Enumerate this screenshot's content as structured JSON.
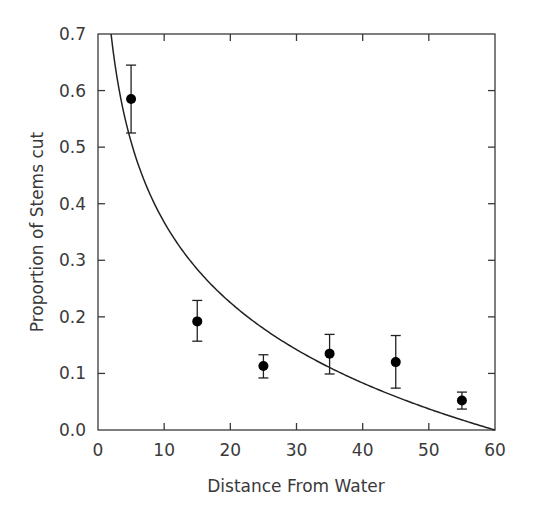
{
  "chart_data": {
    "type": "scatter",
    "title": "",
    "xlabel": "Distance From Water",
    "ylabel": "Proportion of Stems cut",
    "xlim": [
      0,
      60
    ],
    "ylim": [
      0.0,
      0.7
    ],
    "xticks": [
      0,
      10,
      20,
      30,
      40,
      50,
      60
    ],
    "xtick_labels": [
      "0",
      "10",
      "20",
      "30",
      "40",
      "50",
      "60"
    ],
    "yticks": [
      0.0,
      0.1,
      0.2,
      0.3,
      0.4,
      0.5,
      0.6,
      0.7
    ],
    "ytick_labels": [
      "0.0",
      "0.1",
      "0.2",
      "0.3",
      "0.4",
      "0.5",
      "0.6",
      "0.7"
    ],
    "grid": false,
    "legend": null,
    "series": [
      {
        "name": "observed",
        "kind": "points_with_error_bars",
        "x": [
          5,
          15,
          25,
          35,
          45,
          55
        ],
        "y": [
          0.585,
          0.192,
          0.113,
          0.135,
          0.12,
          0.052
        ],
        "err_low": [
          0.525,
          0.157,
          0.092,
          0.099,
          0.074,
          0.037
        ],
        "err_high": [
          0.645,
          0.229,
          0.133,
          0.169,
          0.167,
          0.067
        ]
      },
      {
        "name": "fitted curve",
        "kind": "line",
        "formula": "y = 0.205 * ln(60 / x)",
        "x": [
          3.5,
          5,
          7.5,
          10,
          15,
          20,
          25,
          30,
          35,
          40,
          45,
          50,
          55,
          60
        ],
        "y": [
          0.583,
          0.509,
          0.426,
          0.367,
          0.284,
          0.225,
          0.179,
          0.142,
          0.11,
          0.083,
          0.059,
          0.037,
          0.018,
          0.0
        ]
      }
    ],
    "colors": {
      "axis": "#3a3a3a",
      "markers": "#000000",
      "line": "#222222"
    }
  }
}
